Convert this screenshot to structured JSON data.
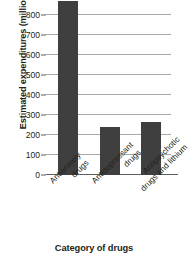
{
  "chart_data": {
    "type": "bar",
    "title": "",
    "xlabel": "Category of drugs",
    "ylabel": "Estimated expenditures (millions)",
    "categories": [
      "Antianxiety drugs",
      "Antidepressant drugs",
      "Antipsychotic drugs and lithium"
    ],
    "category_lines": [
      [
        "Antianxiety",
        "drugs"
      ],
      [
        "Antidepressant",
        "drugs"
      ],
      [
        "Antipsychotic",
        "drugs and lithium"
      ]
    ],
    "values": [
      870,
      240,
      265
    ],
    "value_notes": [
      "bar extends above the top edge of the image (clipped past ~870)",
      "top sits just above the 200 gridline",
      "top sits between the 200 and 300 gridlines"
    ],
    "ylim": [
      0,
      880
    ],
    "yticks": [
      0,
      100,
      200,
      300,
      400,
      500,
      600,
      700,
      800
    ],
    "ytick_labels": [
      "0",
      "100",
      "200",
      "300",
      "400",
      "500",
      "600",
      "700",
      "800"
    ],
    "grid": true,
    "grid_axis": "y",
    "legend": false,
    "legend_position": "none",
    "bar_color": "#3f3f3f",
    "grid_color": "#a8a8a8",
    "axis_color": "#5e5e5e",
    "background": "#ffffff"
  }
}
